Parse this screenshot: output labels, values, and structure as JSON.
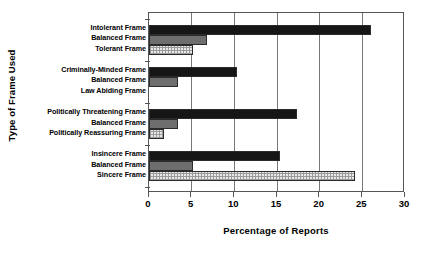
{
  "chart_data": {
    "type": "bar",
    "orientation": "horizontal",
    "title": "",
    "xlabel": "Percentage of Reports",
    "ylabel": "Type of Frame Used",
    "xlim": [
      0,
      30
    ],
    "xticks": [
      0,
      5,
      10,
      15,
      20,
      25,
      30
    ],
    "grid": true,
    "legend": "none",
    "categories": [
      "Intolerant Frame",
      "Balanced Frame",
      "Tolerant Frame",
      "Criminally-Minded Frame",
      "Balanced Frame",
      "Law Abiding Frame",
      "Politically Threatening Frame",
      "Balanced Frame",
      "Politically Reassuring Frame",
      "Insincere  Frame",
      "Balanced Frame",
      "Sincere Frame"
    ],
    "values": [
      26.0,
      6.8,
      5.1,
      10.3,
      3.4,
      0.0,
      17.3,
      3.4,
      1.8,
      15.4,
      5.1,
      24.1
    ],
    "groups": [
      {
        "name": "Tolerance",
        "bars": [
          {
            "label": "Intolerant Frame",
            "value": 26.0,
            "style": "dark"
          },
          {
            "label": "Balanced Frame",
            "value": 6.8,
            "style": "mid"
          },
          {
            "label": "Tolerant Frame",
            "value": 5.1,
            "style": "light"
          }
        ]
      },
      {
        "name": "Criminality",
        "bars": [
          {
            "label": "Criminally-Minded Frame",
            "value": 10.3,
            "style": "dark"
          },
          {
            "label": "Balanced Frame",
            "value": 3.4,
            "style": "mid"
          },
          {
            "label": "Law Abiding Frame",
            "value": 0.0,
            "style": "light"
          }
        ]
      },
      {
        "name": "Political threat",
        "bars": [
          {
            "label": "Politically Threatening Frame",
            "value": 17.3,
            "style": "dark"
          },
          {
            "label": "Balanced Frame",
            "value": 3.4,
            "style": "mid"
          },
          {
            "label": "Politically Reassuring Frame",
            "value": 1.8,
            "style": "light"
          }
        ]
      },
      {
        "name": "Sincerity",
        "bars": [
          {
            "label": "Insincere  Frame",
            "value": 15.4,
            "style": "dark"
          },
          {
            "label": "Balanced Frame",
            "value": 5.1,
            "style": "mid"
          },
          {
            "label": "Sincere Frame",
            "value": 24.1,
            "style": "light"
          }
        ]
      }
    ],
    "tick_labels": [
      "0",
      "5",
      "10",
      "15",
      "20",
      "25",
      "30"
    ],
    "colors": {
      "dark": "#161616",
      "mid": "#6e6e6e",
      "light": "#e8e8e8",
      "axis": "#555555",
      "grid": "#777777",
      "background": "#ffffff"
    }
  }
}
